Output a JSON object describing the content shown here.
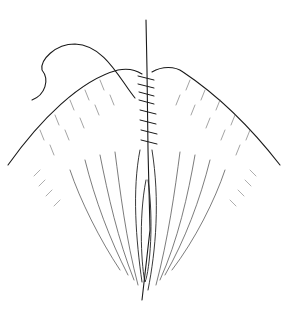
{
  "illustration": {
    "subject": "surgical suture line drawing",
    "background": "#ffffff",
    "stroke": "#1a1a1a",
    "hatch": "#555555"
  }
}
